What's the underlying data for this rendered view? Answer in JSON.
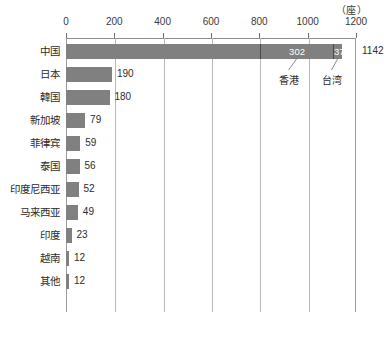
{
  "unit_label": "（座）",
  "chart_data": {
    "type": "bar",
    "orientation": "horizontal",
    "title": "",
    "xlabel": "",
    "ylabel": "",
    "unit": "座",
    "xlim": [
      0,
      1200
    ],
    "xticks": [
      0,
      200,
      400,
      600,
      800,
      1000,
      1200
    ],
    "xtick_labels": [
      "0",
      "200",
      "400",
      "600",
      "800",
      "1000",
      "1200"
    ],
    "grid": true,
    "legend": "none",
    "categories": [
      "中国",
      "日本",
      "韓国",
      "新加坡",
      "菲律宾",
      "泰国",
      "印度尼西亚",
      "马来西亚",
      "印度",
      "越南",
      "其他"
    ],
    "values": [
      1142,
      190,
      180,
      79,
      59,
      56,
      52,
      49,
      23,
      12,
      12
    ],
    "value_labels": [
      "1142",
      "190",
      "180",
      "79",
      "59",
      "56",
      "52",
      "49",
      "23",
      "12",
      "12"
    ],
    "stacked_first_bar": {
      "category": "中国",
      "total": 1142,
      "segments": [
        {
          "name": "",
          "value": 803,
          "label": ""
        },
        {
          "name": "香港",
          "value": 302,
          "label": "302"
        },
        {
          "name": "台湾",
          "value": 37,
          "label": "37"
        }
      ]
    },
    "annotations": [
      {
        "text": "香港",
        "refers_to": 302
      },
      {
        "text": "台湾",
        "refers_to": 37
      }
    ],
    "colors": {
      "bar": "#808080",
      "gridline": "#b8b8b8",
      "axis": "#8d8d8d",
      "text": "#2b2b2b",
      "segment_value_text": "#ffffff",
      "background": "#ffffff"
    }
  }
}
